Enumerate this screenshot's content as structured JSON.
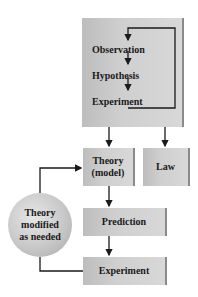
{
  "diagram": {
    "inner_cycle": [
      "Observation",
      "Hypothesis",
      "Experiment"
    ],
    "boxes": {
      "theory": "Theory (model)",
      "theory_line1": "Theory",
      "theory_line2": "(model)",
      "law": "Law",
      "prediction": "Prediction",
      "experiment": "Experiment"
    },
    "circle": {
      "line1": "Theory",
      "line2": "modified",
      "line3": "as needed"
    },
    "colors": {
      "box_fill": "#cfcfcf",
      "line": "#1a1a1a"
    }
  }
}
